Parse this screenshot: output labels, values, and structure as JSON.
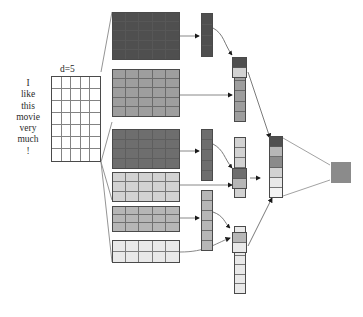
{
  "figure": {
    "sentence_tokens": [
      "I",
      "like",
      "this",
      "movie",
      "very",
      "much",
      "!"
    ],
    "dim_label": "d=5",
    "input_matrix": {
      "name": "input-embedding-matrix",
      "rows": 7,
      "cols": 5,
      "fill": "#ffffff"
    },
    "colors": {
      "very_dark": "#4f4f4f",
      "dark": "#6e6e6e",
      "mid_dark": "#8a8a8a",
      "mid": "#9e9e9e",
      "mid_light": "#b6b6b6",
      "light": "#d2d2d2",
      "very_light": "#e9e9e9",
      "near_white": "#f4f4f4",
      "outline": "#4a4a4a",
      "wire": "#6b6b6b",
      "output": "#8b8b8b"
    },
    "stage1_matrices": [
      {
        "name": "conv-feature-map-1",
        "rows": 5,
        "cols": 5,
        "shade": "very_dark"
      },
      {
        "name": "conv-feature-map-2",
        "rows": 5,
        "cols": 5,
        "shade": "mid"
      },
      {
        "name": "conv-feature-map-3",
        "rows": 4,
        "cols": 5,
        "shade": "dark"
      },
      {
        "name": "conv-feature-map-4",
        "rows": 3,
        "cols": 5,
        "shade": "light"
      },
      {
        "name": "conv-feature-map-5",
        "rows": 3,
        "cols": 5,
        "shade": "mid_light"
      },
      {
        "name": "conv-feature-map-6",
        "rows": 2,
        "cols": 5,
        "shade": "very_light"
      }
    ],
    "stage2_vectors": [
      {
        "name": "pooled-vector-1",
        "cells": 4,
        "shade": "very_dark"
      },
      {
        "name": "pooled-vector-2",
        "cells": 5,
        "shade": "mid"
      },
      {
        "name": "pooled-vector-3",
        "cells": 5,
        "shade": "dark"
      },
      {
        "name": "pooled-vector-4",
        "cells": 6,
        "shade": "light"
      },
      {
        "name": "pooled-vector-5",
        "cells": 6,
        "shade": "mid_light"
      },
      {
        "name": "pooled-vector-6",
        "cells": 7,
        "shade": "very_light"
      }
    ],
    "stage3_merge_cells": [
      {
        "name": "merge-cell-1",
        "cells": [
          "very_dark",
          "light"
        ]
      },
      {
        "name": "merge-cell-2",
        "cells": [
          "dark",
          "mid_light"
        ]
      },
      {
        "name": "merge-cell-3",
        "cells": [
          "mid_light",
          "very_light"
        ]
      }
    ],
    "stage4_vector": {
      "name": "final-feature-vector",
      "cells": [
        "very_dark",
        "mid_light",
        "mid_dark",
        "light",
        "very_light",
        "near_white"
      ]
    },
    "output_node": {
      "name": "output-prediction-node",
      "shade": "output"
    }
  }
}
